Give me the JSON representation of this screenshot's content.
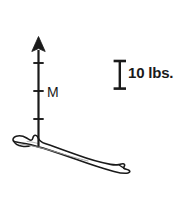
{
  "figure": {
    "background_color": "#ffffff",
    "ink_color": "#1a1a1a",
    "faint_ink_color": "#8a8a8a",
    "width": 183,
    "height": 204
  },
  "force_vector": {
    "label": "M",
    "direction": "up",
    "origin_x": 38,
    "origin_y": 146,
    "tip_y": 37,
    "arrowhead_width": 13,
    "arrowhead_height": 14,
    "shaft_width": 2.2,
    "graduation_count": 3,
    "graduation_y_positions": [
      63,
      91,
      119
    ],
    "graduation_half_width": 5
  },
  "scale_bar": {
    "label": "10 lbs.",
    "magnitude": 10,
    "units": "lbs.",
    "center_x": 120,
    "top_y": 60,
    "bottom_y": 89,
    "cap_half_width": 6,
    "stem_width": 2.4
  },
  "bone": {
    "name": "clavicle",
    "description": "left clavicle shown in superior view, curving down to the right",
    "outline_points_note": "hand-drawn anatomical contour",
    "stroke_width": 1.6,
    "fill": "#ffffff"
  }
}
